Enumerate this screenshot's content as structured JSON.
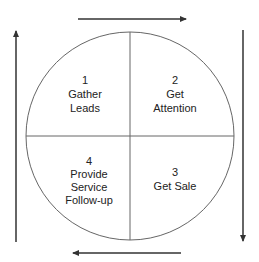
{
  "diagram": {
    "type": "cycle",
    "colors": {
      "line": "#333333",
      "circle": "#666666",
      "text": "#222222",
      "background": "#ffffff"
    },
    "quadrants": [
      {
        "number": "1",
        "lines": [
          "Gather",
          "Leads"
        ],
        "position": "top-left"
      },
      {
        "number": "2",
        "lines": [
          "Get",
          "Attention"
        ],
        "position": "top-right"
      },
      {
        "number": "3",
        "lines": [
          "Get Sale"
        ],
        "position": "bottom-right"
      },
      {
        "number": "4",
        "lines": [
          "Provide",
          "Service",
          "Follow-up"
        ],
        "position": "bottom-left"
      }
    ],
    "arrows": [
      {
        "side": "top",
        "direction": "right"
      },
      {
        "side": "right",
        "direction": "down"
      },
      {
        "side": "bottom",
        "direction": "left"
      },
      {
        "side": "left",
        "direction": "up"
      }
    ]
  }
}
